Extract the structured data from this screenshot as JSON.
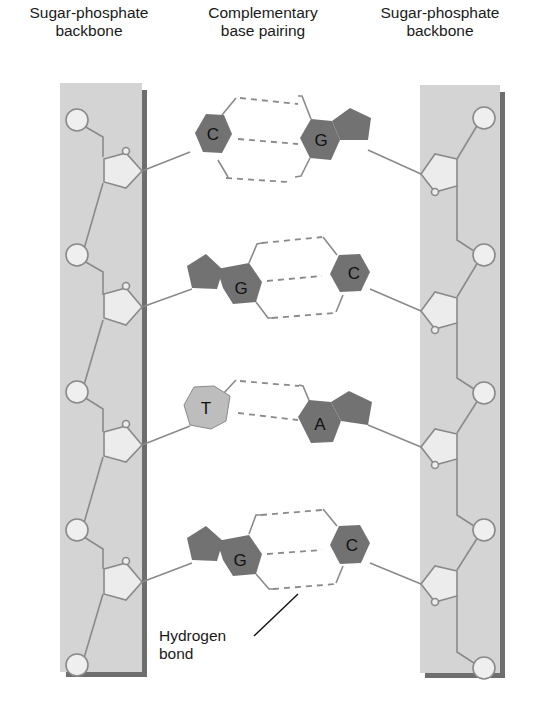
{
  "headers": {
    "left": {
      "line1": "Sugar-phosphate",
      "line2": "backbone"
    },
    "middle": {
      "line1": "Complementary",
      "line2": "base pairing"
    },
    "right": {
      "line1": "Sugar-phosphate",
      "line2": "backbone"
    }
  },
  "base_pairs": [
    {
      "left": "C",
      "right": "G",
      "hydrogen_bonds": 3
    },
    {
      "left": "G",
      "right": "C",
      "hydrogen_bonds": 3
    },
    {
      "left": "T",
      "right": "A",
      "hydrogen_bonds": 2
    },
    {
      "left": "G",
      "right": "C",
      "hydrogen_bonds": 3
    }
  ],
  "annotation": {
    "line1": "Hydrogen",
    "line2": "bond"
  },
  "colors": {
    "backbone_fill": "#d4d4d4",
    "backbone_shadow": "#6e6e6e",
    "purine_pyrimidine_dark": "#727272",
    "thymine_light": "#bdbdbd",
    "sugar_fill": "#ececec",
    "phosphate_fill": "#efefef",
    "line": "#8a8a8a",
    "hbond": "#8a8a8a"
  }
}
